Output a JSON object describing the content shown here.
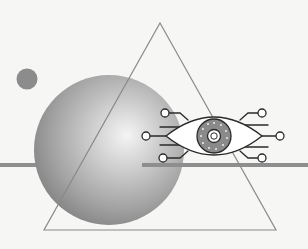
{
  "illustration": {
    "title": "Surveillance eye illustration",
    "colors": {
      "background": "#f6f6f4",
      "sphere_light": "#f2f2f2",
      "sphere_mid": "#b8b8b8",
      "sphere_dark": "#8a8a8a",
      "small_circle": "#8c8c8c",
      "bar": "#8e8e8e",
      "triangle_stroke": "#8a8a8a",
      "eye_stroke": "#2a2a2a",
      "iris_fill": "#8a8a8a"
    },
    "elements": {
      "sphere": "gradient-sphere",
      "small_circle": "small-dot",
      "triangle": "triangle-outline",
      "bar": "horizontal-bar",
      "eye": "eye-icon",
      "circuit": "circuit-lines"
    }
  }
}
